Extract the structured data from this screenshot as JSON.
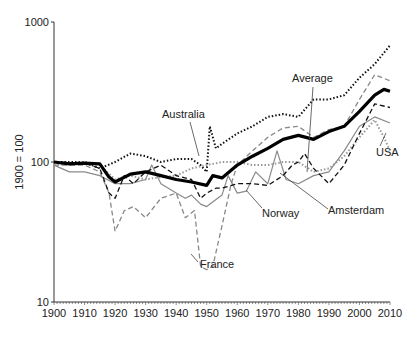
{
  "chart_data": {
    "type": "line",
    "title": "",
    "xlabel": "",
    "ylabel": "1900 = 100",
    "yscale": "log",
    "ylim": [
      10,
      1000
    ],
    "xlim": [
      1900,
      2010
    ],
    "y_ticks": [
      "10",
      "100",
      "1000"
    ],
    "x_ticks": [
      "1900",
      "1910",
      "1920",
      "1930",
      "1940",
      "1950",
      "1960",
      "1970",
      "1980",
      "1990",
      "2000",
      "2010"
    ],
    "grid": false,
    "legend": "inline labels",
    "series": [
      {
        "name": "Average",
        "style": "thick-solid",
        "color": "#000000",
        "x": [
          1900,
          1905,
          1910,
          1915,
          1918,
          1920,
          1925,
          1930,
          1935,
          1940,
          1945,
          1950,
          1952,
          1955,
          1960,
          1965,
          1970,
          1975,
          1980,
          1985,
          1990,
          1995,
          2000,
          2005,
          2008,
          2010
        ],
        "values": [
          100,
          97,
          98,
          97,
          78,
          72,
          82,
          85,
          80,
          75,
          72,
          68,
          80,
          77,
          95,
          110,
          125,
          145,
          155,
          145,
          165,
          180,
          230,
          300,
          330,
          320
        ]
      },
      {
        "name": "Australia",
        "style": "dotted",
        "color": "#111111",
        "x": [
          1900,
          1910,
          1915,
          1920,
          1925,
          1930,
          1935,
          1940,
          1945,
          1948,
          1950,
          1951,
          1953,
          1955,
          1960,
          1965,
          1970,
          1975,
          1980,
          1985,
          1990,
          1995,
          2000,
          2005,
          2010
        ],
        "values": [
          100,
          100,
          90,
          100,
          115,
          110,
          100,
          105,
          105,
          95,
          85,
          180,
          125,
          135,
          160,
          180,
          210,
          220,
          210,
          280,
          280,
          300,
          400,
          500,
          680
        ]
      },
      {
        "name": "France",
        "style": "dashed",
        "color": "#888888",
        "x": [
          1900,
          1910,
          1915,
          1918,
          1920,
          1923,
          1926,
          1930,
          1935,
          1940,
          1943,
          1946,
          1948,
          1950,
          1952,
          1955,
          1958,
          1960,
          1965,
          1970,
          1975,
          1980,
          1985,
          1990,
          1995,
          2000,
          2005,
          2010
        ],
        "values": [
          95,
          95,
          85,
          60,
          32,
          45,
          48,
          40,
          55,
          60,
          40,
          45,
          18,
          17,
          18,
          35,
          70,
          95,
          120,
          150,
          175,
          180,
          150,
          170,
          180,
          280,
          420,
          380
        ]
      },
      {
        "name": "USA",
        "style": "dotted",
        "color": "#999999",
        "x": [
          1900,
          1910,
          1915,
          1920,
          1925,
          1930,
          1935,
          1940,
          1945,
          1950,
          1955,
          1960,
          1965,
          1970,
          1975,
          1980,
          1985,
          1990,
          1995,
          2000,
          2005,
          2008,
          2010
        ],
        "values": [
          95,
          100,
          95,
          75,
          80,
          75,
          78,
          80,
          90,
          95,
          100,
          100,
          95,
          95,
          100,
          100,
          85,
          90,
          110,
          150,
          200,
          150,
          120
        ]
      },
      {
        "name": "Norway",
        "style": "solid",
        "color": "#8a8a8a",
        "x": [
          1900,
          1905,
          1910,
          1915,
          1920,
          1925,
          1930,
          1932,
          1935,
          1940,
          1943,
          1945,
          1948,
          1950,
          1955,
          1957,
          1960,
          1963,
          1966,
          1970,
          1973,
          1976,
          1980,
          1985,
          1990,
          1995,
          2000,
          2005,
          2010
        ],
        "values": [
          95,
          85,
          85,
          80,
          70,
          70,
          75,
          95,
          70,
          60,
          55,
          58,
          50,
          48,
          58,
          80,
          60,
          62,
          85,
          70,
          120,
          75,
          70,
          80,
          85,
          120,
          180,
          210,
          190
        ]
      },
      {
        "name": "Amsterdam",
        "style": "dashed",
        "color": "#111111",
        "x": [
          1900,
          1910,
          1915,
          1918,
          1920,
          1923,
          1926,
          1930,
          1935,
          1940,
          1945,
          1948,
          1950,
          1953,
          1955,
          1960,
          1965,
          1970,
          1975,
          1978,
          1980,
          1982,
          1985,
          1990,
          1995,
          2000,
          2005,
          2010
        ],
        "values": [
          100,
          98,
          90,
          60,
          55,
          80,
          70,
          85,
          95,
          80,
          75,
          55,
          60,
          65,
          65,
          70,
          70,
          68,
          80,
          95,
          100,
          115,
          90,
          70,
          95,
          160,
          260,
          245
        ]
      }
    ],
    "annotations": [
      {
        "text": "Australia",
        "points_to": "Australia",
        "year": 1950
      },
      {
        "text": "Average",
        "points_to": "Average",
        "year": 1983
      },
      {
        "text": "USA",
        "points_to": "USA",
        "year": 2008
      },
      {
        "text": "Norway",
        "points_to": "Norway",
        "year": 1958
      },
      {
        "text": "Amsterdam",
        "points_to": "Norway",
        "year": 1973
      },
      {
        "text": "France",
        "points_to": "France",
        "year": 1950
      }
    ]
  }
}
